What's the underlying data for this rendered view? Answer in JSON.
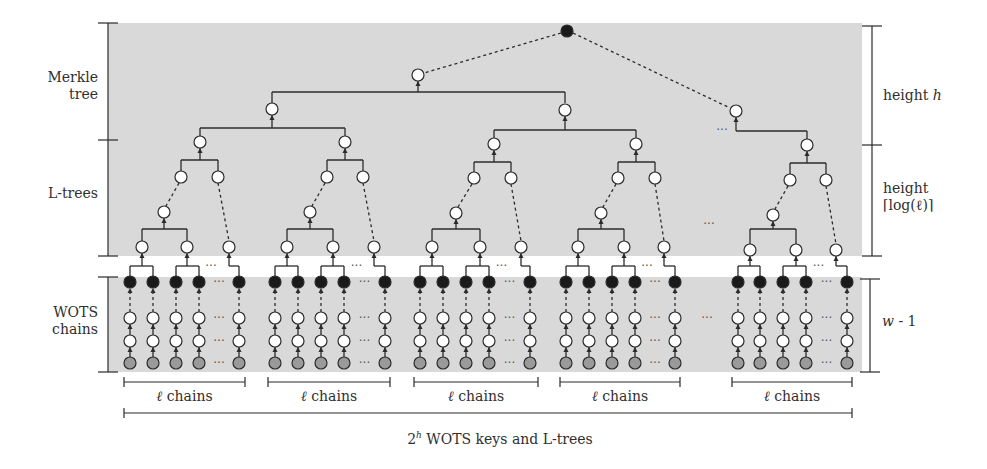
{
  "colors": {
    "band": "#d9d9d9",
    "line": "#2b2b2b",
    "node_white": "#ffffff",
    "node_black": "#1a1a1a",
    "node_gray": "#9a9a9a"
  },
  "left_labels": {
    "merkle": [
      "Merkle",
      "tree"
    ],
    "ltrees": "L-trees",
    "wots": [
      "WOTS",
      "chains"
    ]
  },
  "right_labels": {
    "merkle_height_prefix": "height ",
    "merkle_height_var": "h",
    "ltree_height_line1": "height",
    "ltree_height_line2": "⌈log(ℓ)⌉",
    "wots_len_var": "w",
    "wots_len_suffix": " - 1"
  },
  "bottom_labels": {
    "group_label": "ℓ chains",
    "total_prefix": "2",
    "total_sup": "h",
    "total_suffix": " WOTS keys and L-trees"
  },
  "ellipsis": "···",
  "groups": [
    {
      "cols": [
        130,
        153,
        176,
        199,
        239
      ],
      "ltree": {
        "root": [
          200,
          142
        ],
        "l2": [
          [
            181,
            177
          ],
          [
            218,
            177
          ]
        ],
        "l3": [
          164,
          212
        ],
        "leaves": [
          [
            142,
            247
          ],
          [
            187,
            247
          ],
          [
            229,
            247
          ]
        ]
      },
      "bracket": [
        124,
        245
      ]
    },
    {
      "cols": [
        275,
        298,
        321,
        344,
        385
      ],
      "ltree": {
        "root": [
          345,
          142
        ],
        "l2": [
          [
            327,
            177
          ],
          [
            363,
            177
          ]
        ],
        "l3": [
          310,
          212
        ],
        "leaves": [
          [
            287,
            247
          ],
          [
            333,
            247
          ],
          [
            374,
            247
          ]
        ]
      },
      "bracket": [
        268,
        390
      ]
    },
    {
      "cols": [
        420,
        443,
        466,
        489,
        530
      ],
      "ltree": {
        "root": [
          494,
          144
        ],
        "l2": [
          [
            474,
            178
          ],
          [
            511,
            178
          ]
        ],
        "l3": [
          456,
          213
        ],
        "leaves": [
          [
            432,
            247
          ],
          [
            480,
            247
          ],
          [
            521,
            247
          ]
        ]
      },
      "bracket": [
        414,
        538
      ]
    },
    {
      "cols": [
        566,
        589,
        612,
        635,
        675
      ],
      "ltree": {
        "root": [
          636,
          144
        ],
        "l2": [
          [
            618,
            178
          ],
          [
            655,
            178
          ]
        ],
        "l3": [
          601,
          213
        ],
        "leaves": [
          [
            578,
            247
          ],
          [
            624,
            247
          ],
          [
            664,
            247
          ]
        ]
      },
      "bracket": [
        560,
        680
      ]
    },
    {
      "cols": [
        738,
        760,
        783,
        806,
        847
      ],
      "ltree": {
        "root": [
          807,
          145
        ],
        "l2": [
          [
            790,
            180
          ],
          [
            826,
            180
          ]
        ],
        "l3": [
          773,
          215
        ],
        "leaves": [
          [
            750,
            250
          ],
          [
            796,
            250
          ],
          [
            836,
            250
          ]
        ]
      },
      "bracket": [
        732,
        852
      ]
    }
  ],
  "merkle": {
    "root": [
      567,
      31
    ],
    "level1": [
      [
        418,
        75
      ],
      [
        736,
        111
      ]
    ],
    "level2": [
      [
        272,
        109
      ],
      [
        565,
        110
      ]
    ]
  },
  "rows": {
    "black": 282,
    "white1": 318,
    "white2": 341,
    "gray": 363
  }
}
